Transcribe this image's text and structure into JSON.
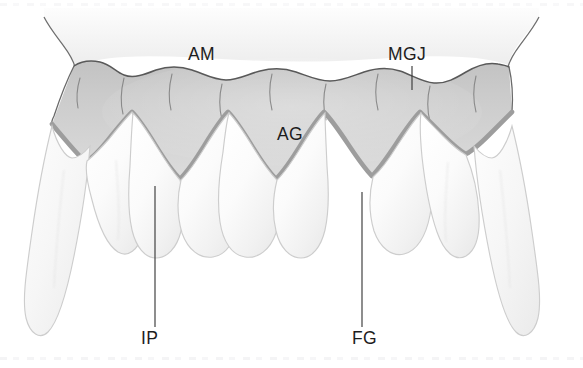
{
  "figure": {
    "width": 583,
    "height": 368,
    "background_color": "#ffffff"
  },
  "colors": {
    "background": "#ffffff",
    "alveolar_mucosa_fill": "#f2f2f2",
    "attached_gingiva_fill": "#c9c9c9",
    "free_gingiva_fill": "#d4d4d4",
    "gingival_margin_stroke": "#9a9a9a",
    "mucogingival_junction_stroke": "#5a5a5a",
    "tooth_fill": "#fbfbfb",
    "tooth_stroke": "#cfcfcf",
    "label_text": "#1d1d1d",
    "leader_line": "#3a3a3a"
  },
  "labels": [
    {
      "id": "am",
      "text": "AM",
      "meaning": "alveolar-mucosa",
      "x": 188,
      "y": 60,
      "has_leader": false
    },
    {
      "id": "mgj",
      "text": "MGJ",
      "meaning": "mucogingival-junction",
      "x": 388,
      "y": 60,
      "has_leader": true,
      "leader": {
        "x1": 412,
        "y1": 66,
        "x2": 412,
        "y2": 90
      }
    },
    {
      "id": "ag",
      "text": "AG",
      "meaning": "attached-gingiva",
      "x": 277,
      "y": 140,
      "has_leader": false
    },
    {
      "id": "ip",
      "text": "IP",
      "meaning": "interdental-papilla",
      "x": 141,
      "y": 344,
      "has_leader": true,
      "leader": {
        "x1": 155,
        "y1": 186,
        "x2": 155,
        "y2": 327
      }
    },
    {
      "id": "fg",
      "text": "FG",
      "meaning": "free-gingiva",
      "x": 352,
      "y": 344,
      "has_leader": true,
      "leader": {
        "x1": 362,
        "y1": 192,
        "x2": 362,
        "y2": 327
      }
    }
  ],
  "structures": {
    "alveolar_mucosa": "AM",
    "mucogingival_junction": "MGJ",
    "attached_gingiva": "AG",
    "interdental_papilla": "IP",
    "free_gingiva": "FG"
  },
  "teeth": {
    "count": 8,
    "description": "Six anterior incisors with a long canine at each end"
  }
}
